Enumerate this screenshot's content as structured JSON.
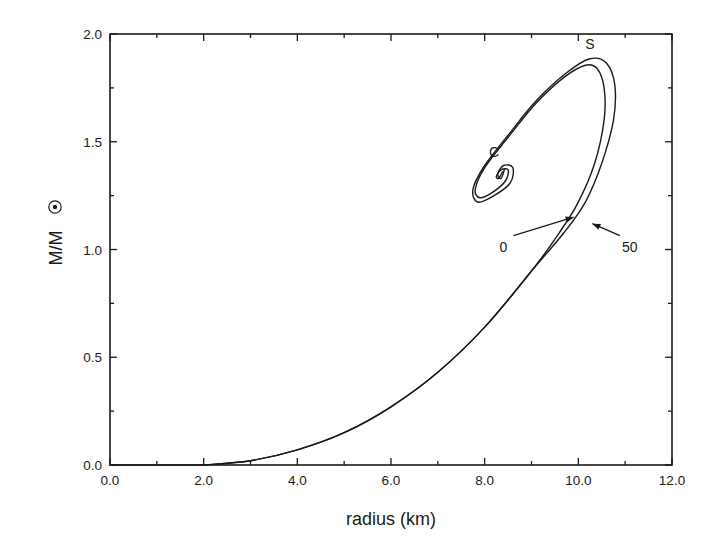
{
  "chart_data": {
    "type": "line",
    "title": "",
    "xlabel": "radius  (km)",
    "ylabel": "M/M",
    "ylabel_subscript_symbol": "sun-symbol",
    "xlim": [
      0.0,
      12.0
    ],
    "ylim": [
      0.0,
      2.0
    ],
    "grid": false,
    "legend": "none",
    "x_ticks": [
      "0.0",
      "2.0",
      "4.0",
      "6.0",
      "8.0",
      "10.0",
      "12.0"
    ],
    "x_tick_values": [
      0,
      2,
      4,
      6,
      8,
      10,
      12
    ],
    "x_minor_ticks": [
      1,
      3,
      5,
      7,
      9,
      11
    ],
    "y_ticks": [
      "0.0",
      "0.5",
      "1.0",
      "1.5",
      "2.0"
    ],
    "y_tick_values": [
      0.0,
      0.5,
      1.0,
      1.5,
      2.0
    ],
    "y_minor_ticks": [
      0.25,
      0.75,
      1.25,
      1.75
    ],
    "series": [
      {
        "name": "0",
        "points": [
          [
            2.0,
            0.0
          ],
          [
            3.0,
            0.02
          ],
          [
            4.0,
            0.07
          ],
          [
            5.0,
            0.15
          ],
          [
            6.0,
            0.27
          ],
          [
            7.0,
            0.43
          ],
          [
            8.0,
            0.64
          ],
          [
            9.0,
            0.9
          ],
          [
            9.6,
            1.08
          ],
          [
            10.0,
            1.22
          ],
          [
            10.35,
            1.4
          ],
          [
            10.55,
            1.6
          ],
          [
            10.55,
            1.75
          ],
          [
            10.4,
            1.84
          ],
          [
            10.15,
            1.855
          ],
          [
            9.7,
            1.8
          ],
          [
            9.1,
            1.68
          ],
          [
            8.5,
            1.52
          ],
          [
            8.0,
            1.38
          ],
          [
            7.8,
            1.28
          ],
          [
            7.9,
            1.24
          ],
          [
            8.2,
            1.27
          ],
          [
            8.45,
            1.32
          ],
          [
            8.5,
            1.37
          ],
          [
            8.35,
            1.37
          ],
          [
            8.25,
            1.34
          ],
          [
            8.3,
            1.33
          ],
          [
            8.38,
            1.36
          ]
        ]
      },
      {
        "name": "50",
        "points": [
          [
            2.0,
            0.0
          ],
          [
            3.0,
            0.02
          ],
          [
            4.0,
            0.07
          ],
          [
            5.0,
            0.15
          ],
          [
            6.0,
            0.27
          ],
          [
            7.0,
            0.43
          ],
          [
            8.0,
            0.64
          ],
          [
            9.0,
            0.9
          ],
          [
            9.7,
            1.08
          ],
          [
            10.15,
            1.22
          ],
          [
            10.5,
            1.4
          ],
          [
            10.75,
            1.6
          ],
          [
            10.78,
            1.76
          ],
          [
            10.6,
            1.865
          ],
          [
            10.25,
            1.885
          ],
          [
            9.75,
            1.82
          ],
          [
            9.1,
            1.69
          ],
          [
            8.5,
            1.53
          ],
          [
            8.0,
            1.39
          ],
          [
            7.75,
            1.28
          ],
          [
            7.85,
            1.22
          ],
          [
            8.2,
            1.25
          ],
          [
            8.55,
            1.31
          ],
          [
            8.6,
            1.38
          ],
          [
            8.4,
            1.39
          ],
          [
            8.28,
            1.35
          ],
          [
            8.35,
            1.33
          ],
          [
            8.42,
            1.37
          ]
        ]
      }
    ],
    "annotations": [
      {
        "text": "S",
        "x": 10.25,
        "y": 1.93,
        "meaning": "stability turning point (maximum mass)"
      },
      {
        "text": "C",
        "x": 8.2,
        "y": 1.43,
        "meaning": "spiral center"
      },
      {
        "text": "0",
        "x": 8.4,
        "y": 0.99,
        "arrow_to": [
          9.9,
          1.15
        ]
      },
      {
        "text": "50",
        "x": 11.1,
        "y": 0.99,
        "arrow_to": [
          10.3,
          1.12
        ]
      }
    ]
  },
  "axes": {
    "xlabel": "radius  (km)",
    "ylabel": "M/M"
  },
  "annotations": {
    "s_label": "S",
    "c_label": "C",
    "zero_label": "0",
    "fifty_label": "50"
  }
}
